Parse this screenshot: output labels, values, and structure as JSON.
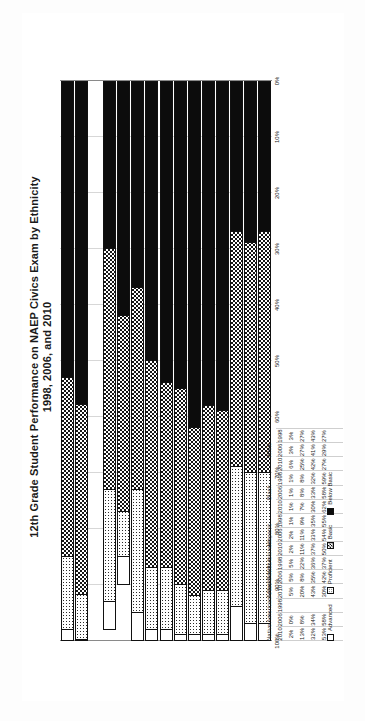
{
  "chart_data": {
    "type": "bar",
    "orientation": "horizontal-stacked",
    "title": "12th Grade Student Performance on NAEP Civics Exam by Ethnicity",
    "subtitle": "1998, 2006, and 2010",
    "xlabel": "",
    "ylabel": "",
    "xlim": [
      0,
      100
    ],
    "grid": true,
    "legend_position": "bottom-left",
    "x_tick_labels": [
      "100%",
      "90%",
      "80%",
      "70%",
      "60%",
      "50%",
      "40%",
      "30%",
      "20%",
      "10%",
      "0%"
    ],
    "x_tick_values": [
      100,
      90,
      80,
      70,
      60,
      50,
      40,
      30,
      20,
      10,
      0
    ],
    "series": [
      {
        "name": "Advanced",
        "pattern": "white"
      },
      {
        "name": "Proficient",
        "pattern": "light-dots"
      },
      {
        "name": "Basic",
        "pattern": "checkered"
      },
      {
        "name": "Below Basic",
        "pattern": "solid-black"
      }
    ],
    "groups": [
      {
        "name": "White",
        "rows": [
          {
            "year": "1998",
            "advanced": 3,
            "proficient": 27,
            "basic": 43,
            "below_basic": 27,
            "labels": [
              "3%",
              "27%",
              "43%",
              "27%"
            ]
          },
          {
            "year": "2006",
            "advanced": 3,
            "proficient": 27,
            "basic": 41,
            "below_basic": 29,
            "labels": [
              "3%",
              "27%",
              "41%",
              "29%"
            ]
          },
          {
            "year": "2010",
            "advanced": 6,
            "proficient": 25,
            "basic": 42,
            "below_basic": 27,
            "labels": [
              "6%",
              "25%",
              "42%",
              "27%"
            ]
          }
        ]
      },
      {
        "name": "Black",
        "rows": [
          {
            "year": "1998",
            "advanced": 1,
            "proficient": 8,
            "basic": 32,
            "below_basic": 59,
            "labels": [
              "1%",
              "8%",
              "32%",
              "59%"
            ]
          },
          {
            "year": "2006",
            "advanced": 1,
            "proficient": 8,
            "basic": 33,
            "below_basic": 58,
            "labels": [
              "1%",
              "8%",
              "33%",
              "58%"
            ]
          },
          {
            "year": "2010",
            "advanced": 1,
            "proficient": 7,
            "basic": 30,
            "below_basic": 62,
            "labels": [
              "1%",
              "7%",
              "30%",
              "62%"
            ]
          }
        ]
      },
      {
        "name": "Hispanic",
        "rows": [
          {
            "year": "1998",
            "advanced": 1,
            "proficient": 9,
            "basic": 35,
            "below_basic": 55,
            "labels": [
              "1%",
              "9%",
              "35%",
              "55%"
            ]
          },
          {
            "year": "2006",
            "advanced": 2,
            "proficient": 11,
            "basic": 33,
            "below_basic": 54,
            "labels": [
              "2%",
              "11%",
              "33%",
              "54%"
            ]
          },
          {
            "year": "2010",
            "advanced": 2,
            "proficient": 11,
            "basic": 37,
            "below_basic": 50,
            "labels": [
              "2%",
              "11%",
              "37%",
              "50%"
            ]
          }
        ]
      },
      {
        "name": "Asian/ Pacific Islander",
        "rows": [
          {
            "year": "1998",
            "advanced": 5,
            "proficient": 22,
            "basic": 36,
            "below_basic": 37,
            "labels": [
              "5%",
              "22%",
              "36%",
              "37%"
            ]
          },
          {
            "year": "2006",
            "advanced": 5,
            "proficient": 8,
            "basic": 35,
            "below_basic": 42,
            "labels": [
              "5%",
              "8%",
              "35%",
              "42%"
            ]
          },
          {
            "year": "2010",
            "advanced": 5,
            "proficient": 20,
            "basic": 43,
            "below_basic": 30,
            "labels": [
              "5%",
              "20%",
              "43%",
              "30%"
            ]
          }
        ]
      },
      {
        "name": "Native American/ Alaska Native",
        "rows": [
          {
            "year": "1998",
            "advanced": null,
            "proficient": null,
            "basic": null,
            "below_basic": null,
            "labels": [
              "",
              "",
              "",
              ""
            ]
          },
          {
            "year": "2006",
            "advanced": 0,
            "proficient": 8,
            "basic": 34,
            "below_basic": 58,
            "labels": [
              "0%",
              "8%",
              "34%",
              "58%"
            ]
          },
          {
            "year": "2010",
            "advanced": 2,
            "proficient": 13,
            "basic": 32,
            "below_basic": 53,
            "labels": [
              "2%",
              "13%",
              "32%",
              "53%"
            ]
          }
        ]
      }
    ]
  },
  "legend": {
    "items": [
      {
        "label": "Advanced",
        "key": "advanced"
      },
      {
        "label": "Proficient",
        "key": "proficient"
      },
      {
        "label": "Basic",
        "key": "basic"
      },
      {
        "label": "Below Basic",
        "key": "belowbasic"
      }
    ]
  }
}
